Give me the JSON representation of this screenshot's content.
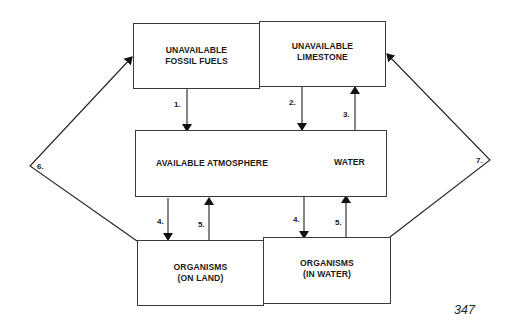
{
  "diagram": {
    "type": "carbon-cycle-flow",
    "boxes": {
      "fossil_fuels": "UNAVAILABLE\nFOSSIL FUELS",
      "limestone": "UNAVAILABLE\nLIMESTONE",
      "atmosphere": "AVAILABLE ATMOSPHERE",
      "water": "WATER",
      "organisms_land": "ORGANISMS\n(ON LAND)",
      "organisms_water": "ORGANISMS\n(IN WATER)"
    },
    "arrow_labels": {
      "a1": "1.",
      "a2": "2.",
      "a3": "3.",
      "a4_land": "4.",
      "a5_land": "5.",
      "a4_water": "4.",
      "a5_water": "5.",
      "a6": "6.",
      "a7": "7."
    },
    "flows": [
      {
        "label": "1.",
        "from": "fossil_fuels",
        "to": "atmosphere"
      },
      {
        "label": "2.",
        "from": "limestone",
        "to": "atmosphere"
      },
      {
        "label": "3.",
        "from": "atmosphere",
        "to": "limestone"
      },
      {
        "label": "4.",
        "from": "atmosphere",
        "to": "organisms_land"
      },
      {
        "label": "5.",
        "from": "organisms_land",
        "to": "atmosphere"
      },
      {
        "label": "4.",
        "from": "atmosphere",
        "to": "organisms_water"
      },
      {
        "label": "5.",
        "from": "organisms_water",
        "to": "atmosphere"
      },
      {
        "label": "6.",
        "from": "organisms_land",
        "to": "fossil_fuels"
      },
      {
        "label": "7.",
        "from": "organisms_water",
        "to": "limestone"
      }
    ],
    "page_number": "347"
  }
}
